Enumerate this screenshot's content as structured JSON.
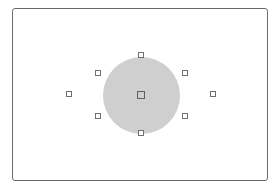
{
  "diagram": {
    "type": "viewfinder-af-points",
    "frame": {
      "left": 12,
      "top": 8,
      "width": 256,
      "height": 173,
      "border_color": "#6a6a6a"
    },
    "metering_zone": {
      "cx": 141,
      "cy": 95,
      "r": 38.5,
      "color": "#cfcfcf"
    },
    "af_points": [
      {
        "id": "top",
        "x": 138,
        "y": 52,
        "size": 6
      },
      {
        "id": "upper-left",
        "x": 95,
        "y": 70,
        "size": 6
      },
      {
        "id": "upper-right",
        "x": 182,
        "y": 70,
        "size": 6
      },
      {
        "id": "far-left",
        "x": 66,
        "y": 91,
        "size": 6
      },
      {
        "id": "center",
        "x": 137,
        "y": 91,
        "size": 8
      },
      {
        "id": "far-right",
        "x": 210,
        "y": 91,
        "size": 6
      },
      {
        "id": "lower-left",
        "x": 95,
        "y": 113,
        "size": 6
      },
      {
        "id": "lower-right",
        "x": 182,
        "y": 113,
        "size": 6
      },
      {
        "id": "bottom",
        "x": 138,
        "y": 130,
        "size": 6
      }
    ]
  }
}
